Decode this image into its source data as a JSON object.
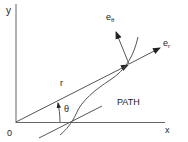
{
  "diagram": {
    "type": "polar-coordinates-unit-vectors",
    "labels": {
      "y_axis": "y",
      "x_axis": "x",
      "origin": "0",
      "radius": "r",
      "angle": "θ",
      "path": "PATH",
      "e_r_base": "e",
      "e_r_sub": "r",
      "e_theta_base": "e",
      "e_theta_sub": "θ"
    },
    "colors": {
      "line": "#555555",
      "text": "#222222"
    }
  }
}
